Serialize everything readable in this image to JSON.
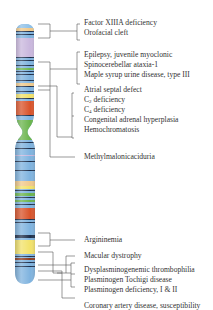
{
  "diagram": {
    "type": "chromosome-gene-map",
    "colors": {
      "chromosome_base": "#7fb3df",
      "line": "#555555",
      "text": "#333333",
      "band_dark": "#1d2e4a",
      "band_orange": "#d9532a",
      "band_yellow": "#f2e26a",
      "band_purple": "#c9b7dd",
      "band_green": "#6ab44c",
      "band_tan": "#f0c98a"
    },
    "groups": [
      {
        "id": "g1",
        "labels": [
          "Factor XIIIA deficiency",
          "Orofacial cleft"
        ]
      },
      {
        "id": "g2",
        "labels": [
          "Epilepsy, juvenile myoclonic",
          "Spinocerebellar ataxia-1",
          "Maple syrup urine disease, type III"
        ]
      },
      {
        "id": "g3",
        "labels": [
          "Atrial septal defect",
          "C2 deficiency",
          "C4 deficiency",
          "Congenital adrenal hyperplasia",
          "Hemochromatosis"
        ]
      },
      {
        "id": "g4",
        "labels": [
          "Methylmalonicaciduria"
        ]
      },
      {
        "id": "g5",
        "labels": [
          "Argininemia"
        ]
      },
      {
        "id": "g6",
        "labels": [
          "Macular dystrophy"
        ]
      },
      {
        "id": "g7",
        "labels": [
          "Dysplasminogenemic thrombophilia",
          "Plasminogen Tochigi disease",
          "Plasminogen deficiency, I & II"
        ]
      },
      {
        "id": "g8",
        "labels": [
          "Coronary artery disease, susceptibility"
        ]
      }
    ],
    "subscripts": {
      "C2": "2",
      "C4": "4"
    }
  }
}
